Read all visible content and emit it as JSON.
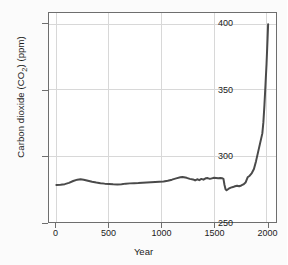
{
  "chart_data": {
    "type": "line",
    "title": "",
    "xlabel": "Year",
    "ylabel": "Carbon dioxide (CO2) (ppm)",
    "ylabel_base": "Carbon dioxide (CO",
    "ylabel_sub": "2",
    "ylabel_tail": ") (ppm)",
    "xlim": [
      -70,
      2090
    ],
    "ylim": [
      250,
      408
    ],
    "grid": true,
    "legend": null,
    "xticks": [
      0,
      500,
      1000,
      1500,
      2000
    ],
    "xtick_labels": [
      "0",
      "500",
      "1000",
      "1500",
      "2000"
    ],
    "yticks": [
      250,
      300,
      350,
      400
    ],
    "ytick_labels": [
      "250",
      "300",
      "350",
      "400"
    ],
    "series": [
      {
        "name": "Atmospheric CO2 concentration",
        "color": "#4a4a4a",
        "x": [
          0,
          40,
          80,
          120,
          160,
          200,
          230,
          260,
          300,
          340,
          380,
          420,
          460,
          500,
          540,
          580,
          620,
          660,
          700,
          740,
          780,
          820,
          860,
          900,
          940,
          980,
          1020,
          1060,
          1100,
          1140,
          1180,
          1200,
          1240,
          1270,
          1300,
          1320,
          1340,
          1360,
          1380,
          1400,
          1420,
          1440,
          1460,
          1480,
          1500,
          1520,
          1540,
          1560,
          1580,
          1590,
          1600,
          1610,
          1620,
          1640,
          1660,
          1680,
          1700,
          1720,
          1740,
          1760,
          1780,
          1800,
          1820,
          1840,
          1860,
          1880,
          1900,
          1920,
          1940,
          1960,
          1970,
          1980,
          1990,
          2000,
          2010,
          2015
        ],
        "y": [
          278.0,
          278.2,
          278.6,
          279.6,
          281.0,
          282.0,
          282.3,
          282.0,
          281.2,
          280.4,
          279.8,
          279.3,
          279.0,
          278.8,
          278.5,
          278.3,
          278.6,
          279.0,
          279.2,
          279.3,
          279.4,
          279.6,
          279.8,
          280.0,
          280.2,
          280.4,
          280.6,
          281.2,
          282.0,
          283.0,
          283.8,
          284.0,
          283.4,
          282.6,
          282.2,
          281.4,
          282.3,
          281.6,
          282.6,
          282.0,
          283.0,
          283.2,
          282.6,
          283.0,
          283.4,
          283.2,
          283.0,
          283.2,
          283.0,
          282.6,
          278.0,
          274.8,
          274.0,
          275.2,
          276.0,
          276.4,
          277.0,
          277.4,
          277.0,
          277.6,
          278.4,
          279.8,
          283.8,
          285.0,
          287.0,
          290.0,
          296.0,
          303.0,
          310.0,
          317.0,
          325.5,
          338.5,
          354.0,
          369.5,
          389.0,
          399.5
        ]
      }
    ]
  }
}
